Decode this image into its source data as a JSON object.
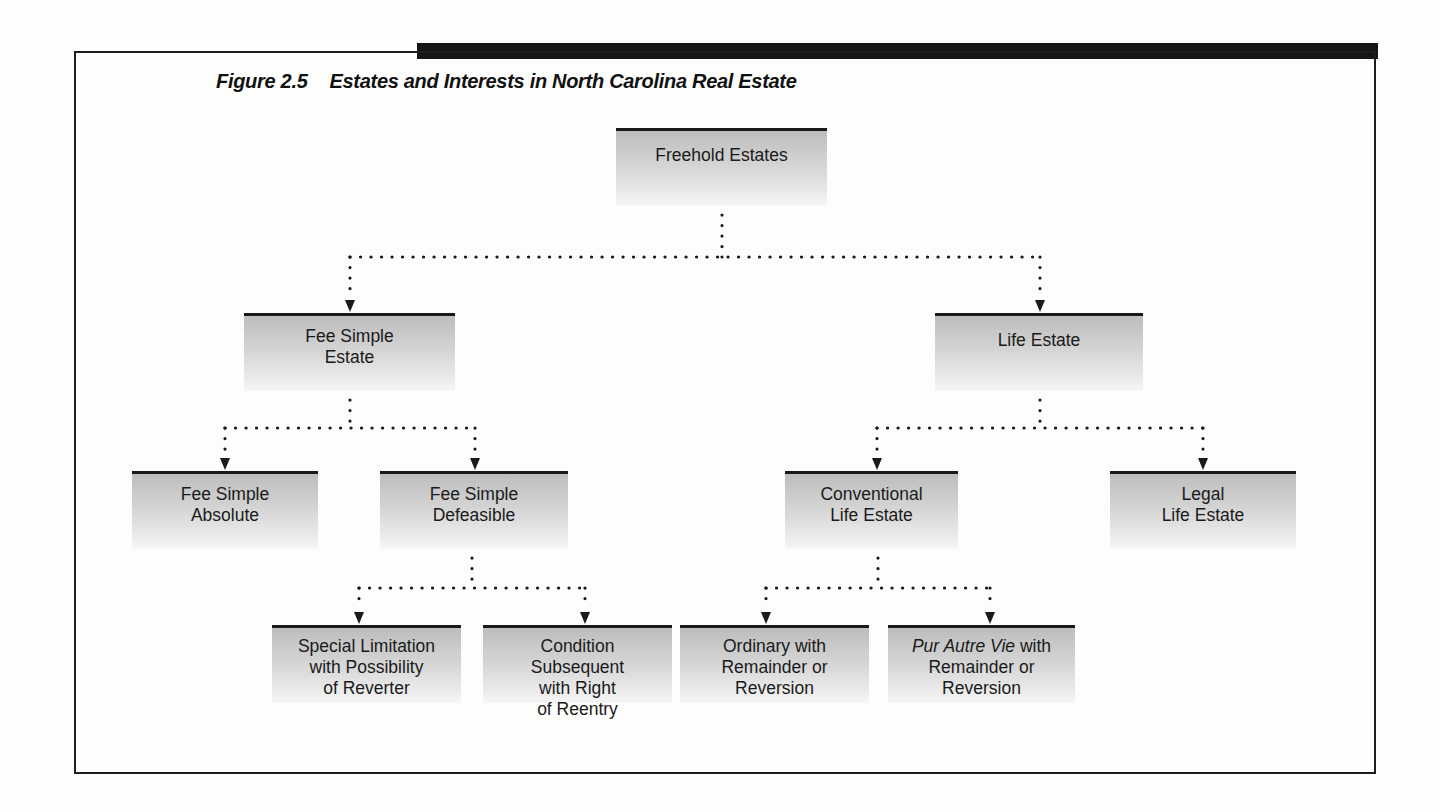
{
  "figure": {
    "number": "Figure 2.5",
    "title": "Estates and Interests in North Carolina Real Estate"
  },
  "nodes": {
    "freehold": {
      "lines": [
        "Freehold Estates"
      ]
    },
    "fee_simple_estate": {
      "lines": [
        "Fee Simple",
        "Estate"
      ]
    },
    "life_estate": {
      "lines": [
        "Life Estate"
      ]
    },
    "fee_simple_absolute": {
      "lines": [
        "Fee Simple",
        "Absolute"
      ]
    },
    "fee_simple_defeasible": {
      "lines": [
        "Fee Simple",
        "Defeasible"
      ]
    },
    "conventional_life_estate": {
      "lines": [
        "Conventional",
        "Life Estate"
      ]
    },
    "legal_life_estate": {
      "lines": [
        "Legal",
        "Life Estate"
      ]
    },
    "special_limitation": {
      "lines": [
        "Special Limitation",
        "with Possibility",
        "of Reverter"
      ]
    },
    "condition_subsequent": {
      "lines": [
        "Condition",
        "Subsequent",
        "with Right",
        "of Reentry"
      ]
    },
    "ordinary": {
      "lines": [
        "Ordinary with",
        "Remainder or",
        "Reversion"
      ]
    },
    "pur_autre_vie": {
      "italic_prefix": "Pur Autre Vie",
      "suffix": " with",
      "lines": [
        "Remainder or",
        "Reversion"
      ]
    }
  },
  "hierarchy": {
    "Freehold Estates": [
      "Fee Simple Estate",
      "Life Estate"
    ],
    "Fee Simple Estate": [
      "Fee Simple Absolute",
      "Fee Simple Defeasible"
    ],
    "Fee Simple Defeasible": [
      "Special Limitation with Possibility of Reverter",
      "Condition Subsequent with Right of Reentry"
    ],
    "Life Estate": [
      "Conventional Life Estate",
      "Legal Life Estate"
    ],
    "Conventional Life Estate": [
      "Ordinary with Remainder or Reversion",
      "Pur Autre Vie with Remainder or Reversion"
    ]
  },
  "colors": {
    "frame": "#1d1d1d",
    "topbar": "#161616",
    "node_top": "#bdbdbd",
    "node_bottom": "#f6f6f6",
    "connector": "#1a1a1a"
  }
}
